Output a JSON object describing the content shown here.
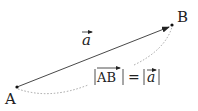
{
  "diagram": {
    "points": {
      "A": {
        "label": "A",
        "x": 17,
        "y": 87
      },
      "B": {
        "label": "B",
        "x": 172,
        "y": 25
      }
    },
    "vector_label": "a",
    "equation": {
      "left": "AB",
      "equals": "=",
      "right": "a"
    },
    "colors": {
      "line": "#222222",
      "dotted": "#999999"
    }
  }
}
